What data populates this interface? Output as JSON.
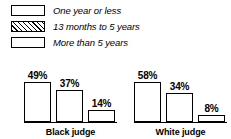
{
  "chart_data": {
    "type": "bar",
    "title": "",
    "subtitle": "",
    "xlabel": "",
    "ylabel": "",
    "ylim": [
      0,
      60
    ],
    "grid": false,
    "legend_position": "top-left",
    "categories": [
      "Black judge",
      "White judge"
    ],
    "series": [
      {
        "name": "One year or less",
        "pattern": "dotted",
        "values": [
          49,
          58
        ],
        "labels": [
          "49%",
          "58%"
        ]
      },
      {
        "name": "13 months to 5 years",
        "pattern": "diagonal-hatch",
        "values": [
          37,
          34
        ],
        "labels": [
          "37%",
          "34%"
        ]
      },
      {
        "name": "More than 5 years",
        "pattern": "empty",
        "values": [
          14,
          8
        ],
        "labels": [
          "14%",
          "8%"
        ]
      }
    ],
    "value_suffix": "%",
    "colors": {
      "outline": "#000000",
      "background": "#ffffff",
      "dot_fill": "#5a5a5a",
      "text": "#000000"
    }
  },
  "legend": {
    "items": [
      {
        "label": "One year or less",
        "swatch": "dotted-swatch"
      },
      {
        "label": "13 months to 5 years",
        "swatch": "hatched-swatch"
      },
      {
        "label": "More than 5 years",
        "swatch": "empty-swatch"
      }
    ]
  },
  "groups": [
    {
      "label": "Black judge",
      "bars": [
        {
          "label": "49%",
          "value": 49
        },
        {
          "label": "37%",
          "value": 37
        },
        {
          "label": "14%",
          "value": 14
        }
      ]
    },
    {
      "label": "White judge",
      "bars": [
        {
          "label": "58%",
          "value": 58
        },
        {
          "label": "34%",
          "value": 34
        },
        {
          "label": "8%",
          "value": 8
        }
      ]
    }
  ]
}
